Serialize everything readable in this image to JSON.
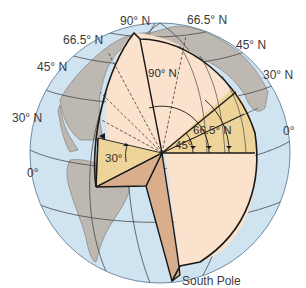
{
  "diagram": {
    "outer_labels": {
      "north_pole": "90° N",
      "left_66": "66.5° N",
      "left_45": "45° N",
      "left_30": "30° N",
      "left_equator": "0°",
      "right_66": "66.5° N",
      "right_45": "45° N",
      "right_30": "30° N",
      "right_equator": "0°",
      "south_pole": "South Pole"
    },
    "inner_labels": {
      "angle_90": "90° N",
      "angle_66": "66.5° N",
      "angle_45": "45°",
      "angle_30": "30°"
    },
    "colors": {
      "ocean": "#cfe3f1",
      "land": "#bdb8b1",
      "wedge_light": "#fbe2cc",
      "wedge_tan": "#efd49a",
      "wedge_side": "#d9ae8c",
      "outline": "#1a1a1a",
      "grid": "#4a4a4a"
    }
  }
}
